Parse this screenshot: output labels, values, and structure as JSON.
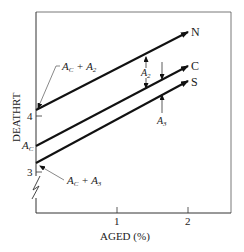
{
  "diagram": {
    "y_axis_label": "DEATHRT",
    "x_axis_label": "AGED (%)",
    "y_ticks": [
      {
        "label": "4",
        "y": 116
      },
      {
        "label": "3",
        "y": 172
      }
    ],
    "x_ticks": [
      {
        "label": "1",
        "x": 117
      },
      {
        "label": "2",
        "x": 188
      }
    ],
    "lines": [
      {
        "name": "N",
        "label": "N"
      },
      {
        "name": "C",
        "label": "C"
      },
      {
        "name": "S",
        "label": "S"
      }
    ],
    "annotations": {
      "ac_plus_a2": "A_C + A_2",
      "ac": "A_C",
      "ac_plus_a3": "A_C + A_3",
      "a2": "A_2",
      "a3": "A_3"
    }
  }
}
